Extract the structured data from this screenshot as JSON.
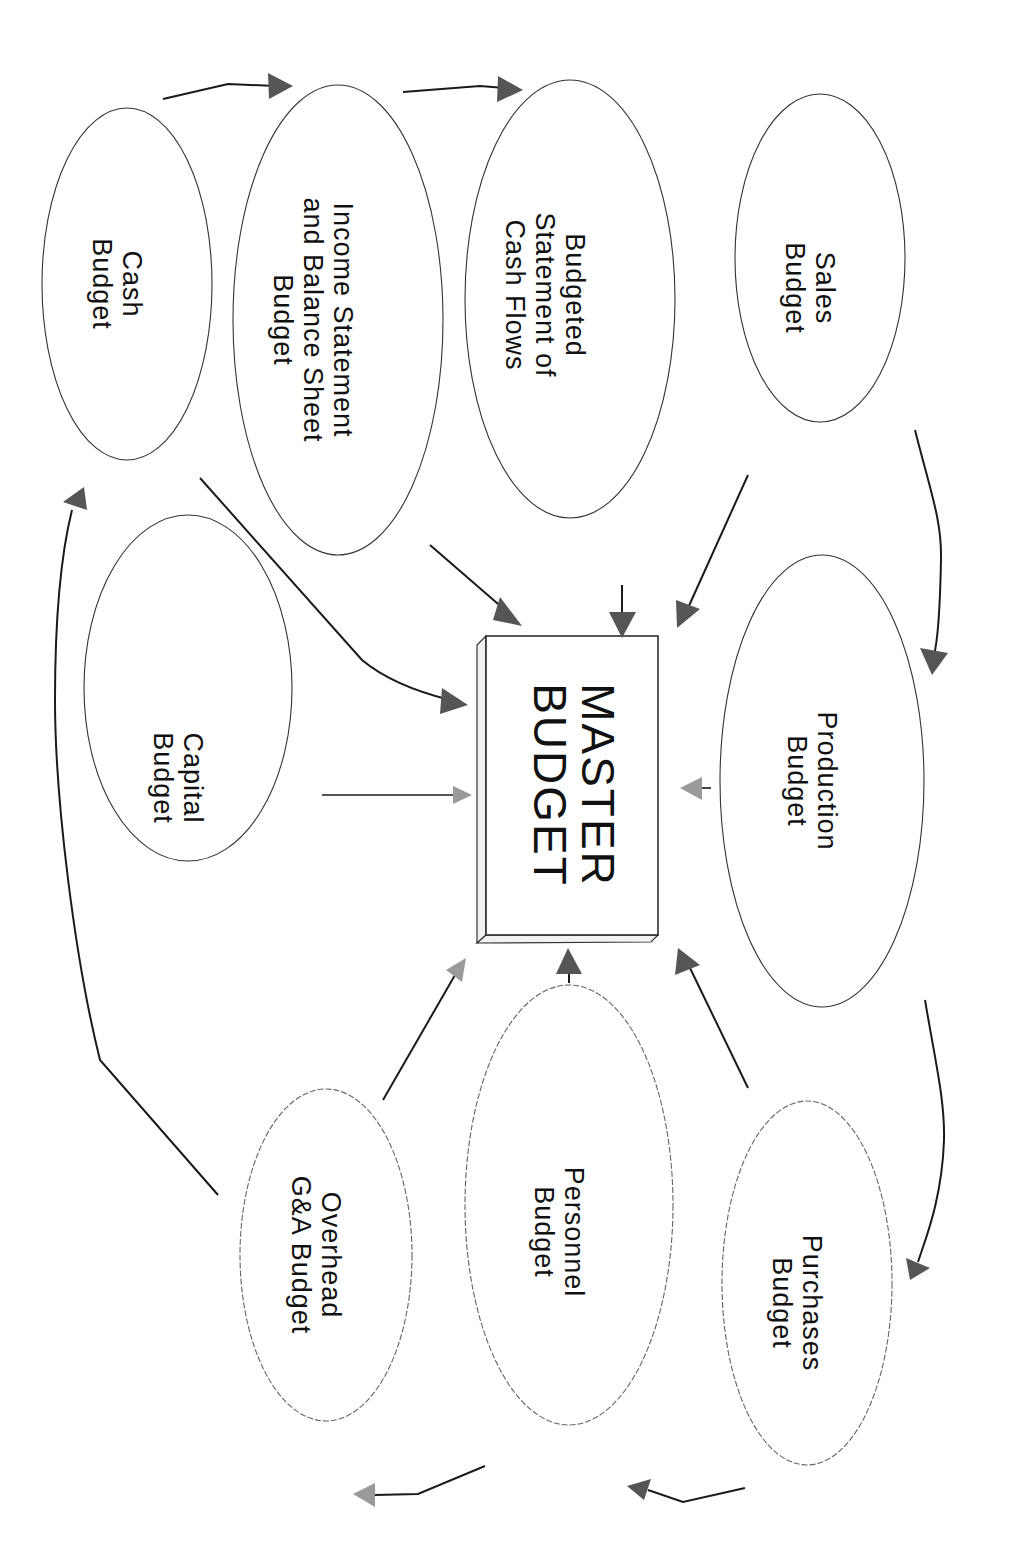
{
  "diagram": {
    "orientation": "rotated 90 degrees clockwise",
    "center": {
      "id": "master",
      "lines": [
        "MASTER",
        "BUDGET"
      ]
    },
    "nodes": [
      {
        "id": "cash",
        "lines": [
          "Cash",
          "Budget"
        ]
      },
      {
        "id": "income",
        "lines": [
          "Income Statement",
          "and Balance Sheet",
          "Budget"
        ]
      },
      {
        "id": "cashflows",
        "lines": [
          "Budgeted",
          "Statement of",
          "Cash Flows"
        ]
      },
      {
        "id": "sales",
        "lines": [
          "Sales",
          "Budget"
        ]
      },
      {
        "id": "capital",
        "lines": [
          "Capital",
          "Budget"
        ]
      },
      {
        "id": "production",
        "lines": [
          "Production",
          "Budget"
        ]
      },
      {
        "id": "overhead",
        "lines": [
          "Overhead",
          "G&A Budget"
        ]
      },
      {
        "id": "personnel",
        "lines": [
          "Personnel",
          "Budget"
        ]
      },
      {
        "id": "purchases",
        "lines": [
          "Purchases",
          "Budget"
        ]
      }
    ],
    "edges": [
      {
        "from": "cash",
        "to": "income"
      },
      {
        "from": "income",
        "to": "cashflows"
      },
      {
        "from": "sales",
        "to": "production"
      },
      {
        "from": "production",
        "to": "purchases"
      },
      {
        "from": "purchases",
        "to": "personnel"
      },
      {
        "from": "personnel",
        "to": "overhead"
      },
      {
        "from": "overhead",
        "to": "cash"
      },
      {
        "from": "cash",
        "to": "master"
      },
      {
        "from": "income",
        "to": "master"
      },
      {
        "from": "cashflows",
        "to": "master"
      },
      {
        "from": "sales",
        "to": "master"
      },
      {
        "from": "capital",
        "to": "master"
      },
      {
        "from": "production",
        "to": "master"
      },
      {
        "from": "overhead",
        "to": "master"
      },
      {
        "from": "personnel",
        "to": "master"
      },
      {
        "from": "purchases",
        "to": "master"
      }
    ]
  }
}
